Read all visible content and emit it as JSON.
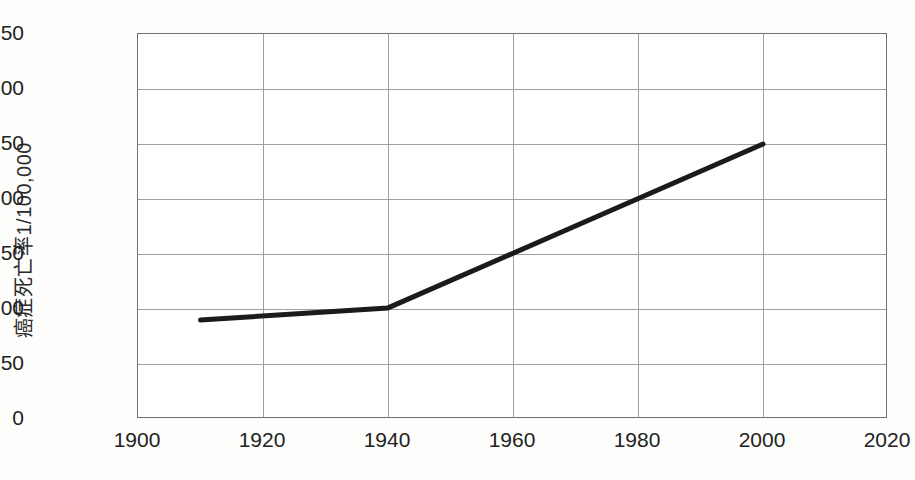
{
  "chart_data": {
    "type": "line",
    "title": "",
    "subtitle": "",
    "xlabel": "",
    "ylabel": "癌症死亡率1/100,000",
    "xlim": [
      1900,
      2020
    ],
    "ylim": [
      0,
      350
    ],
    "xticks": [
      1900,
      1920,
      1940,
      1960,
      1980,
      2000,
      2020
    ],
    "yticks": [
      0,
      50,
      100,
      150,
      200,
      250,
      300,
      350
    ],
    "grid": true,
    "legend": "none",
    "series": [
      {
        "name": "癌症死亡率",
        "color": "#1b1b1b",
        "line_width": 5,
        "x": [
          1910,
          1940,
          2000
        ],
        "values": [
          90,
          101,
          250
        ]
      }
    ]
  },
  "axes": {
    "y_title": "癌症死亡率1/100,000",
    "y_tick_labels": [
      "350",
      "300",
      "250",
      "200",
      "150",
      "100",
      "50",
      "0"
    ],
    "x_tick_labels": [
      "1900",
      "1920",
      "1940",
      "1960",
      "1980",
      "2000",
      "2020"
    ]
  },
  "style": {
    "background": "#fdfdfc",
    "plot_background": "#fffffe",
    "grid_color": "#a0a0a0",
    "frame_color": "#707070",
    "line_color": "#1b1b1b",
    "text_color": "#222222"
  }
}
